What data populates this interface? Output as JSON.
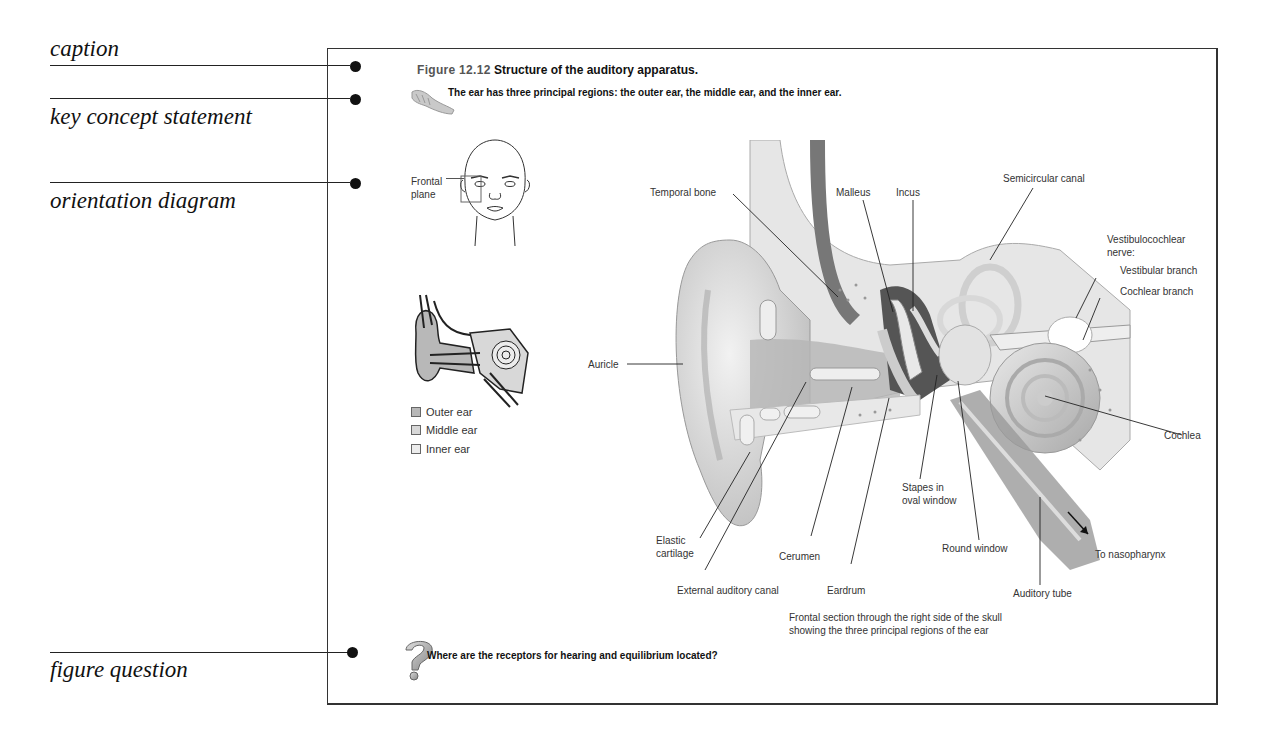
{
  "annotations": [
    {
      "id": "caption",
      "label": "caption"
    },
    {
      "id": "key-concept",
      "label": "key concept statement"
    },
    {
      "id": "orientation",
      "label": "orientation diagram"
    },
    {
      "id": "figure-question",
      "label": "figure question"
    }
  ],
  "figure": {
    "number": "Figure 12.12",
    "title": "Structure of the auditory apparatus.",
    "key_concept": "The ear has three principal regions: the outer ear, the middle ear, and the inner ear.",
    "orientation": {
      "plane_label_line1": "Frontal",
      "plane_label_line2": "plane"
    },
    "legend": [
      {
        "label": "Outer ear",
        "color": "#b8b8b8"
      },
      {
        "label": "Middle ear",
        "color": "#d8d8d8"
      },
      {
        "label": "Inner ear",
        "color": "#ececec"
      }
    ],
    "labels": {
      "temporal_bone": "Temporal bone",
      "malleus": "Malleus",
      "incus": "Incus",
      "semicircular_canal": "Semicircular canal",
      "vestibulocochlear_1": "Vestibulocochlear",
      "vestibulocochlear_2": "nerve:",
      "vestibular_branch": "Vestibular branch",
      "cochlear_branch": "Cochlear branch",
      "auricle": "Auricle",
      "cochlea": "Cochlea",
      "stapes_1": "Stapes in",
      "stapes_2": "oval window",
      "elastic_1": "Elastic",
      "elastic_2": "cartilage",
      "cerumen": "Cerumen",
      "round_window": "Round window",
      "to_nasopharynx": "To nasopharynx",
      "external_auditory_canal": "External auditory canal",
      "eardrum": "Eardrum",
      "auditory_tube": "Auditory tube"
    },
    "section_caption_1": "Frontal section through the right side of the skull",
    "section_caption_2": "showing the three principal regions of the ear",
    "question": "Where are the receptors for hearing and equilibrium located?"
  }
}
